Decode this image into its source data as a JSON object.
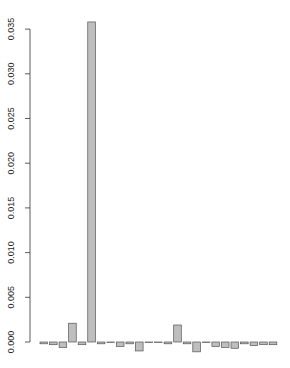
{
  "chart_data": {
    "type": "bar",
    "title": "",
    "xlabel": "",
    "ylabel": "",
    "ylim": [
      -0.0012,
      0.0365
    ],
    "grid": false,
    "legend": null,
    "y_ticks": [
      0.0,
      0.005,
      0.01,
      0.015,
      0.02,
      0.025,
      0.03,
      0.035
    ],
    "y_tick_labels": [
      "0.000",
      "0.005",
      "0.010",
      "0.015",
      "0.020",
      "0.025",
      "0.030",
      "0.035"
    ],
    "categories": [
      "1",
      "2",
      "3",
      "4",
      "5",
      "6",
      "7",
      "8",
      "9",
      "10",
      "11",
      "12",
      "13",
      "14",
      "15",
      "16",
      "17",
      "18",
      "19",
      "20",
      "21",
      "22",
      "23",
      "24",
      "25"
    ],
    "values": [
      -0.0002,
      -0.0003,
      -0.0006,
      0.0021,
      -0.0003,
      0.0358,
      -0.0002,
      -5e-05,
      -0.0005,
      -0.0002,
      -0.001,
      -5e-05,
      -5e-05,
      -0.0002,
      0.0019,
      -0.0002,
      -0.0011,
      -5e-05,
      -0.0005,
      -0.0006,
      -0.0007,
      -0.0002,
      -0.0004,
      -0.0003,
      -0.0003
    ],
    "bar_color": "#bebebe",
    "bar_border_color": "#555555"
  }
}
